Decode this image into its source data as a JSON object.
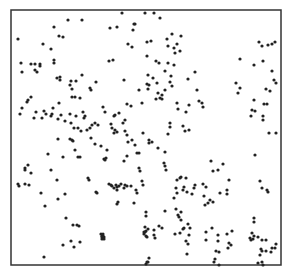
{
  "chart_data": {
    "type": "scatter",
    "title": "",
    "xlabel": "",
    "ylabel": "",
    "grid": false,
    "legend": null,
    "frame": {
      "x0": 11,
      "y0": 10,
      "x1": 281,
      "y1": 265,
      "color": "#333333"
    },
    "point_color": "#222222",
    "point_radius": 1.6,
    "points": [
      [
        122,
        13
      ],
      [
        68,
        20
      ],
      [
        82,
        20
      ],
      [
        134,
        24
      ],
      [
        54,
        27
      ],
      [
        117,
        27
      ],
      [
        59,
        36
      ],
      [
        63,
        37
      ],
      [
        18,
        39
      ],
      [
        43,
        44
      ],
      [
        51,
        49
      ],
      [
        110,
        28
      ],
      [
        133,
        30
      ],
      [
        135,
        24
      ],
      [
        160,
        18
      ],
      [
        154,
        13
      ],
      [
        145,
        13
      ],
      [
        151,
        41
      ],
      [
        147,
        42
      ],
      [
        167,
        39
      ],
      [
        172,
        34
      ],
      [
        168,
        46
      ],
      [
        174,
        48
      ],
      [
        181,
        36
      ],
      [
        177,
        44
      ],
      [
        180,
        51
      ],
      [
        175,
        53
      ],
      [
        159,
        63
      ],
      [
        168,
        63
      ],
      [
        156,
        61
      ],
      [
        174,
        65
      ],
      [
        165,
        71
      ],
      [
        171,
        76
      ],
      [
        188,
        79
      ],
      [
        197,
        90
      ],
      [
        203,
        107
      ],
      [
        199,
        101
      ],
      [
        202,
        103
      ],
      [
        186,
        112
      ],
      [
        189,
        105
      ],
      [
        170,
        82
      ],
      [
        172,
        86
      ],
      [
        195,
        72
      ],
      [
        148,
        75
      ],
      [
        153,
        78
      ],
      [
        157,
        83
      ],
      [
        259,
        42
      ],
      [
        262,
        46
      ],
      [
        268,
        45
      ],
      [
        272,
        44
      ],
      [
        275,
        42
      ],
      [
        240,
        59
      ],
      [
        254,
        65
      ],
      [
        263,
        61
      ],
      [
        272,
        71
      ],
      [
        236,
        83
      ],
      [
        240,
        88
      ],
      [
        238,
        93
      ],
      [
        274,
        80
      ],
      [
        276,
        83
      ],
      [
        266,
        89
      ],
      [
        270,
        91
      ],
      [
        254,
        100
      ],
      [
        264,
        104
      ],
      [
        267,
        104
      ],
      [
        252,
        110
      ],
      [
        255,
        111
      ],
      [
        251,
        116
      ],
      [
        263,
        116
      ],
      [
        263,
        120
      ],
      [
        276,
        133
      ],
      [
        269,
        133
      ],
      [
        21,
        63
      ],
      [
        22,
        72
      ],
      [
        31,
        64
      ],
      [
        35,
        64
      ],
      [
        40,
        64
      ],
      [
        40,
        66
      ],
      [
        35,
        70
      ],
      [
        37,
        72
      ],
      [
        54,
        63
      ],
      [
        54,
        60
      ],
      [
        57,
        78
      ],
      [
        60,
        77
      ],
      [
        60,
        80
      ],
      [
        70,
        85
      ],
      [
        71,
        81
      ],
      [
        76,
        81
      ],
      [
        82,
        75
      ],
      [
        72,
        89
      ],
      [
        90,
        88
      ],
      [
        91,
        90
      ],
      [
        113,
        60
      ],
      [
        109,
        61
      ],
      [
        96,
        82
      ],
      [
        72,
        97
      ],
      [
        75,
        97
      ],
      [
        80,
        98
      ],
      [
        28,
        100
      ],
      [
        27,
        102
      ],
      [
        31,
        97
      ],
      [
        20,
        114
      ],
      [
        22,
        108
      ],
      [
        36,
        112
      ],
      [
        59,
        103
      ],
      [
        51,
        116
      ],
      [
        52,
        114
      ],
      [
        53,
        108
      ],
      [
        58,
        119
      ],
      [
        61,
        115
      ],
      [
        46,
        114
      ],
      [
        42,
        118
      ],
      [
        34,
        118
      ],
      [
        44,
        111
      ],
      [
        65,
        121
      ],
      [
        70,
        114
      ],
      [
        76,
        116
      ],
      [
        78,
        128
      ],
      [
        74,
        128
      ],
      [
        81,
        131
      ],
      [
        71,
        123
      ],
      [
        84,
        118
      ],
      [
        85,
        116
      ],
      [
        90,
        128
      ],
      [
        87,
        130
      ],
      [
        95,
        123
      ],
      [
        83,
        112
      ],
      [
        92,
        125
      ],
      [
        98,
        125
      ],
      [
        103,
        107
      ],
      [
        105,
        112
      ],
      [
        114,
        116
      ],
      [
        115,
        115
      ],
      [
        112,
        128
      ],
      [
        115,
        130
      ],
      [
        114,
        133
      ],
      [
        128,
        44
      ],
      [
        132,
        47
      ],
      [
        147,
        56
      ],
      [
        124,
        80
      ],
      [
        127,
        104
      ],
      [
        131,
        106
      ],
      [
        142,
        103
      ],
      [
        111,
        124
      ],
      [
        119,
        113
      ],
      [
        125,
        120
      ],
      [
        117,
        132
      ],
      [
        156,
        99
      ],
      [
        160,
        98
      ],
      [
        158,
        93
      ],
      [
        162,
        99
      ],
      [
        162,
        95
      ],
      [
        165,
        90
      ],
      [
        148,
        89
      ],
      [
        147,
        84
      ],
      [
        149,
        85
      ],
      [
        177,
        103
      ],
      [
        178,
        109
      ],
      [
        139,
        90
      ],
      [
        123,
        123
      ],
      [
        143,
        133
      ],
      [
        158,
        148
      ],
      [
        168,
        134
      ],
      [
        170,
        123
      ],
      [
        170,
        127
      ],
      [
        185,
        131
      ],
      [
        189,
        130
      ],
      [
        183,
        126
      ],
      [
        58,
        139
      ],
      [
        48,
        154
      ],
      [
        70,
        139
      ],
      [
        72,
        140
      ],
      [
        73,
        141
      ],
      [
        75,
        150
      ],
      [
        63,
        157
      ],
      [
        78,
        157
      ],
      [
        80,
        157
      ],
      [
        91,
        138
      ],
      [
        95,
        144
      ],
      [
        101,
        146
      ],
      [
        104,
        159
      ],
      [
        105,
        160
      ],
      [
        106,
        158
      ],
      [
        107,
        150
      ],
      [
        125,
        131
      ],
      [
        127,
        135
      ],
      [
        128,
        142
      ],
      [
        132,
        140
      ],
      [
        139,
        153
      ],
      [
        137,
        153
      ],
      [
        139,
        168
      ],
      [
        140,
        171
      ],
      [
        137,
        193
      ],
      [
        134,
        203
      ],
      [
        136,
        190
      ],
      [
        143,
        185
      ],
      [
        142,
        181
      ],
      [
        135,
        145
      ],
      [
        124,
        161
      ],
      [
        127,
        156
      ],
      [
        131,
        186
      ],
      [
        25,
        168
      ],
      [
        25,
        170
      ],
      [
        28,
        165
      ],
      [
        31,
        173
      ],
      [
        18,
        184
      ],
      [
        19,
        186
      ],
      [
        25,
        184
      ],
      [
        29,
        185
      ],
      [
        41,
        193
      ],
      [
        51,
        170
      ],
      [
        45,
        206
      ],
      [
        58,
        199
      ],
      [
        65,
        194
      ],
      [
        57,
        180
      ],
      [
        66,
        218
      ],
      [
        73,
        225
      ],
      [
        79,
        226
      ],
      [
        77,
        225
      ],
      [
        63,
        245
      ],
      [
        71,
        241
      ],
      [
        74,
        247
      ],
      [
        80,
        242
      ],
      [
        44,
        257
      ],
      [
        88,
        178
      ],
      [
        89,
        180
      ],
      [
        96,
        192
      ],
      [
        97,
        193
      ],
      [
        112,
        186
      ],
      [
        109,
        184
      ],
      [
        111,
        185
      ],
      [
        116,
        185
      ],
      [
        117,
        190
      ],
      [
        119,
        186
      ],
      [
        121,
        184
      ],
      [
        117,
        187
      ],
      [
        114,
        188
      ],
      [
        127,
        186
      ],
      [
        125,
        185
      ],
      [
        124,
        188
      ],
      [
        118,
        202
      ],
      [
        117,
        204
      ],
      [
        102,
        236
      ],
      [
        103,
        236
      ],
      [
        101,
        234
      ],
      [
        104,
        237
      ],
      [
        102,
        237
      ],
      [
        103,
        234
      ],
      [
        102,
        239
      ],
      [
        104,
        239
      ],
      [
        149,
        143
      ],
      [
        149,
        140
      ],
      [
        152,
        142
      ],
      [
        165,
        166
      ],
      [
        165,
        152
      ],
      [
        164,
        163
      ],
      [
        166,
        170
      ],
      [
        181,
        177
      ],
      [
        180,
        178
      ],
      [
        183,
        190
      ],
      [
        184,
        187
      ],
      [
        186,
        178
      ],
      [
        176,
        188
      ],
      [
        177,
        180
      ],
      [
        177,
        193
      ],
      [
        187,
        192
      ],
      [
        192,
        194
      ],
      [
        194,
        188
      ],
      [
        195,
        185
      ],
      [
        203,
        184
      ],
      [
        206,
        187
      ],
      [
        204,
        196
      ],
      [
        208,
        203
      ],
      [
        205,
        205
      ],
      [
        213,
        202
      ],
      [
        210,
        200
      ],
      [
        220,
        193
      ],
      [
        227,
        190
      ],
      [
        227,
        194
      ],
      [
        229,
        180
      ],
      [
        218,
        170
      ],
      [
        223,
        164
      ],
      [
        211,
        161
      ],
      [
        213,
        171
      ],
      [
        174,
        198
      ],
      [
        176,
        209
      ],
      [
        165,
        211
      ],
      [
        178,
        215
      ],
      [
        181,
        212
      ],
      [
        179,
        217
      ],
      [
        181,
        220
      ],
      [
        184,
        228
      ],
      [
        183,
        229
      ],
      [
        190,
        228
      ],
      [
        188,
        224
      ],
      [
        180,
        233
      ],
      [
        175,
        234
      ],
      [
        189,
        235
      ],
      [
        206,
        232
      ],
      [
        212,
        228
      ],
      [
        218,
        235
      ],
      [
        218,
        241
      ],
      [
        227,
        234
      ],
      [
        232,
        231
      ],
      [
        229,
        243
      ],
      [
        231,
        245
      ],
      [
        228,
        248
      ],
      [
        219,
        252
      ],
      [
        216,
        251
      ],
      [
        215,
        259
      ],
      [
        214,
        262
      ],
      [
        219,
        265
      ],
      [
        206,
        240
      ],
      [
        255,
        155
      ],
      [
        260,
        181
      ],
      [
        262,
        188
      ],
      [
        267,
        190
      ],
      [
        268,
        192
      ],
      [
        254,
        218
      ],
      [
        254,
        222
      ],
      [
        252,
        233
      ],
      [
        254,
        236
      ],
      [
        250,
        238
      ],
      [
        253,
        239
      ],
      [
        251,
        240
      ],
      [
        258,
        237
      ],
      [
        262,
        240
      ],
      [
        266,
        240
      ],
      [
        262,
        251
      ],
      [
        260,
        255
      ],
      [
        271,
        252
      ],
      [
        272,
        248
      ],
      [
        263,
        265
      ],
      [
        262,
        262
      ],
      [
        258,
        263
      ],
      [
        275,
        248
      ],
      [
        276,
        244
      ],
      [
        266,
        251
      ],
      [
        261,
        249
      ],
      [
        146,
        216
      ],
      [
        146,
        212
      ],
      [
        145,
        227
      ],
      [
        144,
        232
      ],
      [
        148,
        229
      ],
      [
        154,
        230
      ],
      [
        162,
        228
      ],
      [
        159,
        226
      ],
      [
        155,
        238
      ],
      [
        147,
        237
      ],
      [
        186,
        241
      ],
      [
        188,
        244
      ],
      [
        187,
        254
      ],
      [
        149,
        258
      ],
      [
        147,
        262
      ],
      [
        146,
        264
      ],
      [
        148,
        262
      ],
      [
        154,
        235
      ],
      [
        146,
        236
      ],
      [
        144,
        234
      ],
      [
        146,
        231
      ],
      [
        145,
        232
      ]
    ]
  }
}
